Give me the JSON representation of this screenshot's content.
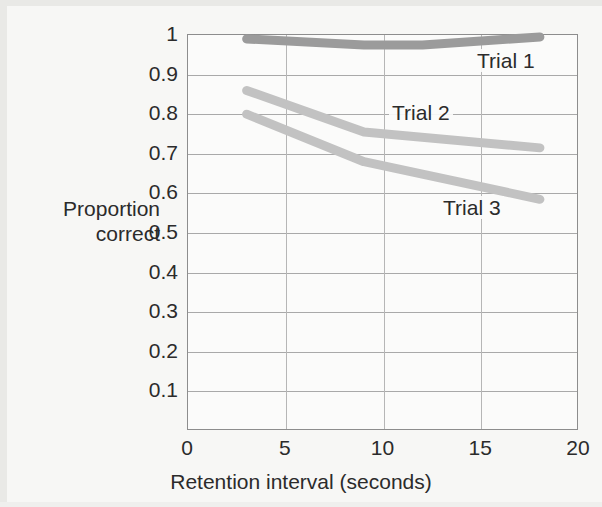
{
  "chart_data": {
    "type": "line",
    "title": "",
    "xlabel": "Retention interval (seconds)",
    "ylabel": "Proportion correct",
    "ylabel_lines": [
      "Proportion",
      "correct"
    ],
    "xlim": [
      0,
      20
    ],
    "ylim": [
      0,
      1
    ],
    "xticks": [
      "0",
      "5",
      "10",
      "15",
      "20"
    ],
    "xtick_values": [
      0,
      5,
      10,
      15,
      20
    ],
    "yticks": [
      "0",
      "0.1",
      "0.2",
      "0.3",
      "0.4",
      "0.5",
      "0.6",
      "0.7",
      "0.8",
      "0.9",
      "1"
    ],
    "ytick_values": [
      0,
      0.1,
      0.2,
      0.3,
      0.4,
      0.5,
      0.6,
      0.7,
      0.8,
      0.9,
      1.0
    ],
    "grid": "horizontal-and-vertical",
    "legend": "inline-labels",
    "series": [
      {
        "name": "Trial 1",
        "color": "#9b9b9b",
        "x": [
          3,
          9,
          12,
          18
        ],
        "values": [
          0.99,
          0.975,
          0.975,
          0.995
        ]
      },
      {
        "name": "Trial 2",
        "color": "#c2c2c2",
        "x": [
          3,
          9,
          18
        ],
        "values": [
          0.86,
          0.755,
          0.715
        ]
      },
      {
        "name": "Trial 3",
        "color": "#c2c2c2",
        "x": [
          3,
          9,
          18
        ],
        "values": [
          0.8,
          0.68,
          0.585
        ]
      }
    ]
  },
  "colors": {
    "page_background": "#f7f7f5",
    "plot_background": "#fbfbfa",
    "axis": "#8d8d8d",
    "gridline": "#a9a9a9",
    "text": "#2b2b2b",
    "trial_1_line": "#9b9b9b",
    "trial_2_line": "#c2c2c2",
    "trial_3_line": "#c2c2c2"
  },
  "geometry": {
    "plot_left": 187,
    "plot_top": 34,
    "plot_width": 391,
    "plot_height": 396
  }
}
